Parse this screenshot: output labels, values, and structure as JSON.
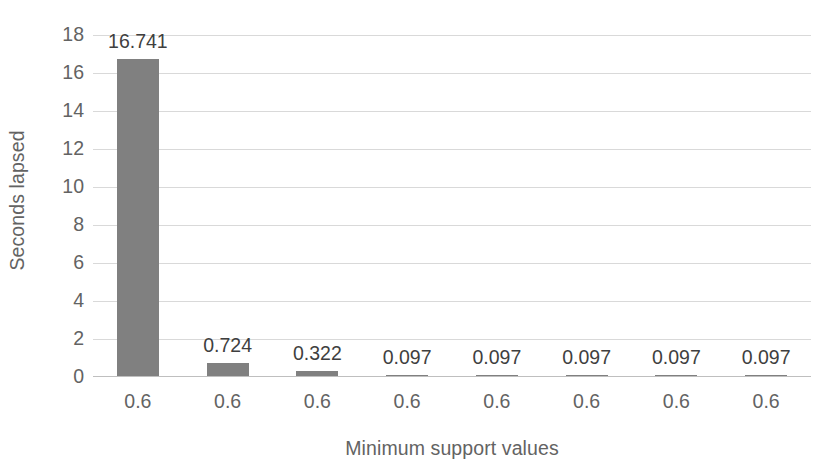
{
  "chart_data": {
    "type": "bar",
    "title": "",
    "xlabel": "Minimum support values",
    "ylabel": "Seconds lapsed",
    "categories": [
      "0.6",
      "0.6",
      "0.6",
      "0.6",
      "0.6",
      "0.6",
      "0.6",
      "0.6"
    ],
    "values": [
      16.741,
      0.724,
      0.322,
      0.097,
      0.097,
      0.097,
      0.097,
      0.097
    ],
    "data_labels": [
      "16.741",
      "0.724",
      "0.322",
      "0.097",
      "0.097",
      "0.097",
      "0.097",
      "0.097"
    ],
    "ylim": [
      0,
      18
    ],
    "ytick_labels": [
      "18",
      "16",
      "14",
      "12",
      "10",
      "8",
      "6",
      "4",
      "2",
      "0"
    ],
    "ytick_values": [
      18,
      16,
      14,
      12,
      10,
      8,
      6,
      4,
      2,
      0
    ],
    "ytick_step": 2,
    "grid": true,
    "grid_axis": "y",
    "legend": false,
    "legend_position": "none",
    "series": [
      {
        "name": "Seconds lapsed",
        "values": [
          16.741,
          0.724,
          0.322,
          0.097,
          0.097,
          0.097,
          0.097,
          0.097
        ]
      }
    ],
    "colors": {
      "bar": "#808080",
      "gridline": "#d9d9d9",
      "axis_line": "#bfbfbf",
      "axis_text": "#636363",
      "data_label_text": "#3f3f3f",
      "background": "#ffffff"
    }
  }
}
